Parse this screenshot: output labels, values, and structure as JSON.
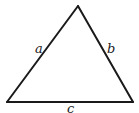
{
  "diagram": {
    "type": "triangle",
    "stroke_color": "#1a1a1a",
    "background": "#ffffff",
    "vertices": {
      "apex": [
        78,
        6
      ],
      "bottom_left": [
        7,
        102
      ],
      "bottom_right": [
        133,
        102
      ]
    },
    "labels": {
      "a": "a",
      "b": "b",
      "c": "c"
    }
  }
}
